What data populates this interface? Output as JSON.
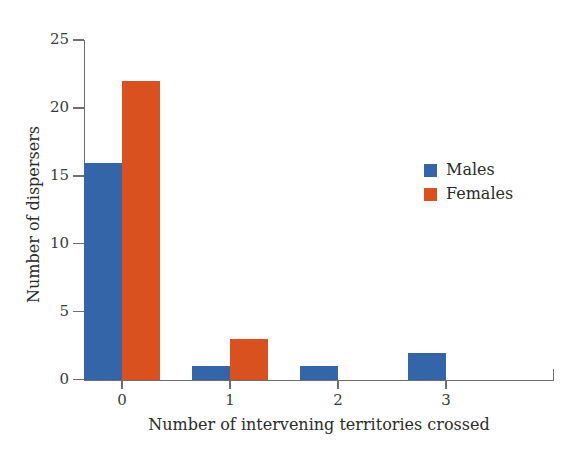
{
  "chart_data": {
    "type": "bar",
    "title": "",
    "xlabel": "Number of intervening territories crossed",
    "ylabel": "Number of dispersers",
    "categories": [
      "0",
      "1",
      "2",
      "3"
    ],
    "series": [
      {
        "name": "Males",
        "color": "#3465a8",
        "values": [
          16,
          1,
          1,
          2
        ]
      },
      {
        "name": "Females",
        "color": "#d9511f",
        "values": [
          22,
          3,
          0,
          0
        ]
      }
    ],
    "ylim": [
      0,
      25
    ],
    "yticks": [
      0,
      5,
      10,
      15,
      20,
      25
    ],
    "ytick_labels": [
      "0",
      "5",
      "10",
      "15",
      "20",
      "25"
    ],
    "xtick_labels": [
      "0",
      "1",
      "2",
      "3"
    ],
    "grid": false,
    "legend_position": "center-right",
    "legend": [
      {
        "label": "Males",
        "color": "#3465a8"
      },
      {
        "label": "Females",
        "color": "#d9511f"
      }
    ],
    "axis_color": "#6e6e6e",
    "background": "#ffffff"
  }
}
